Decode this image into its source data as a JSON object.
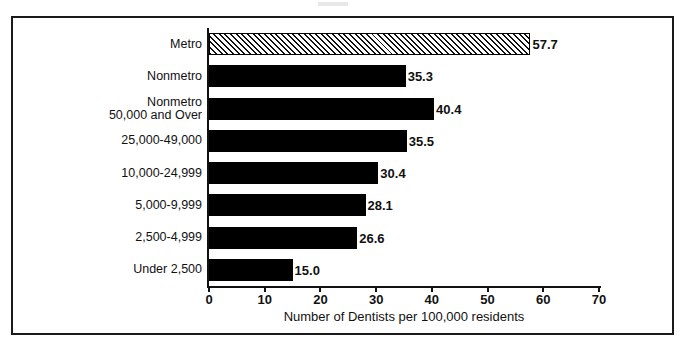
{
  "chart_data": {
    "type": "bar",
    "orientation": "horizontal",
    "title": "",
    "xlabel": "Number of Dentists per 100,000 residents",
    "ylabel": "",
    "xlim": [
      0,
      70
    ],
    "xticks": [
      0,
      10,
      20,
      30,
      40,
      50,
      60,
      70
    ],
    "xtick_labels": [
      "0",
      "10",
      "20",
      "30",
      "40",
      "50",
      "60",
      "70"
    ],
    "grid": false,
    "legend": false,
    "categories": [
      "Metro",
      "Nonmetro",
      "Nonmetro\n50,000 and Over",
      "25,000-49,000",
      "10,000-24,999",
      "5,000-9,999",
      "2,500-4,999",
      "Under 2,500"
    ],
    "values": [
      57.7,
      35.3,
      40.4,
      35.5,
      30.4,
      28.1,
      26.6,
      15.0
    ],
    "value_labels": [
      "57.7",
      "35.3",
      "40.4",
      "35.5",
      "30.4",
      "28.1",
      "26.6",
      "15.0"
    ],
    "bar_styles": [
      "hatched",
      "solid",
      "solid",
      "solid",
      "solid",
      "solid",
      "solid",
      "solid"
    ],
    "colors": {
      "bar_solid": "#000000",
      "bar_hatch_line": "#111111",
      "bar_hatch_background": "#ffffff",
      "axis": "#111111",
      "text": "#111111",
      "frame": "#1a1a1a",
      "background": "#ffffff"
    }
  }
}
